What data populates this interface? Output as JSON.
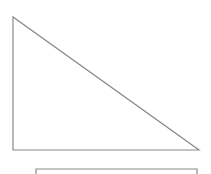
{
  "diagram": {
    "type": "right-triangle",
    "stroke_color": "#8a8a8a",
    "triangle": {
      "vertices": [
        [
          13,
          17
        ],
        [
          13,
          150
        ],
        [
          199,
          150
        ]
      ]
    },
    "bracket": {
      "x1": 36,
      "x2": 197,
      "y": 169,
      "tick": 5
    }
  }
}
